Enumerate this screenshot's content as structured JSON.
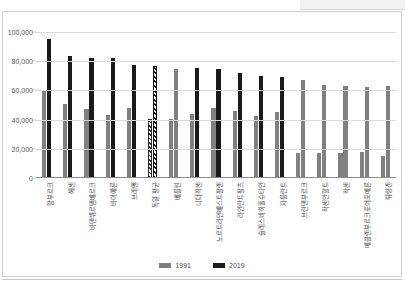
{
  "chart_data": {
    "type": "bar",
    "title": "",
    "subtitle": "",
    "xlabel": "",
    "ylabel": "",
    "ylim": [
      0,
      100000
    ],
    "y_ticks": [
      0,
      20000,
      40000,
      60000,
      80000,
      100000
    ],
    "y_tick_labels": [
      "0",
      "20,000",
      "40,000",
      "60,000",
      "80,000",
      "100,000"
    ],
    "grid": true,
    "legend_position": "bottom",
    "categories": [
      "함부르크",
      "헤센",
      "바덴뷔르템베르크",
      "바이에른",
      "브레멘",
      "독일 평균",
      "베를린",
      "니더작센",
      "노르트라인베스트팔렌",
      "라인란트팔츠",
      "슐레스비히홀슈타인",
      "자를란트",
      "브란덴부르크",
      "작센안할트",
      "작센",
      "메클렌부르크포어포메른",
      "튀링겐"
    ],
    "series": [
      {
        "name": "1991",
        "color": "#808080",
        "values": [
          59600,
          50500,
          47000,
          43500,
          47800,
          40600,
          40600,
          44000,
          47700,
          45700,
          42400,
          45000,
          17100,
          17200,
          17300,
          18000,
          15000
        ]
      },
      {
        "name": "2019",
        "color": "#1a1a1a",
        "values": [
          95500,
          83500,
          82300,
          82400,
          77600,
          76700,
          74900,
          75300,
          74800,
          71900,
          69700,
          68900,
          66900,
          63800,
          62900,
          62600,
          62700
        ]
      }
    ],
    "hatched_category": "독일 평균",
    "note_highlight": "National average bars rendered with diagonal hatch fill",
    "east_german_states_gray_2019": [
      "브란덴부르크",
      "작센안할트",
      "작센",
      "메클렌부르크포어포메른",
      "튀링겐",
      "베를린"
    ]
  },
  "legend": {
    "items": [
      {
        "label": "1991",
        "color": "#808080"
      },
      {
        "label": "2019",
        "color": "#1a1a1a"
      }
    ]
  },
  "top_strip": {
    "text": ""
  }
}
